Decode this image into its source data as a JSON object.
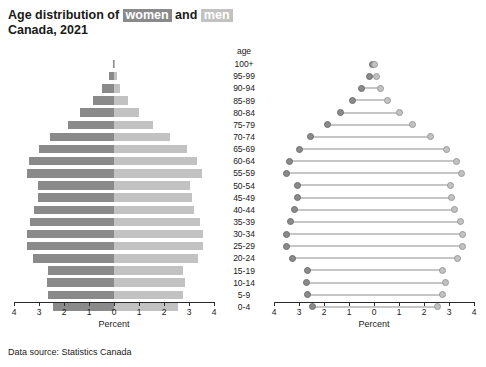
{
  "title": {
    "line1_prefix": "Age distribution of ",
    "women_word": "women",
    "and_word": " and ",
    "men_word": "men",
    "line2": "Canada, 2021"
  },
  "footer": {
    "text": "Data source: Statistics Canada"
  },
  "colors": {
    "women": "#8a8a8a",
    "men": "#c2c2c2",
    "axis": "#2a2a2a",
    "background": "#ffffff"
  },
  "age_column": {
    "header": "age"
  },
  "axis": {
    "title": "Percent",
    "tick_labels": [
      "4",
      "3",
      "2",
      "1",
      "0",
      "1",
      "2",
      "3",
      "4"
    ],
    "tick_values": [
      -4,
      -3,
      -2,
      -1,
      0,
      1,
      2,
      3,
      4
    ],
    "min": -4,
    "max": 4
  },
  "chart_data": [
    {
      "type": "bar",
      "title": "Age distribution of women and men, Canada, 2021",
      "subtype": "population-pyramid",
      "xlabel": "Percent",
      "ylabel": "age",
      "xlim": [
        -4,
        4
      ],
      "grid": false,
      "legend": [
        "women",
        "men"
      ],
      "categories": [
        "100+",
        "95-99",
        "90-94",
        "85-89",
        "80-84",
        "75-79",
        "70-74",
        "65-69",
        "60-64",
        "55-59",
        "50-54",
        "45-49",
        "40-44",
        "35-39",
        "30-34",
        "25-29",
        "20-24",
        "15-19",
        "10-14",
        "5-9",
        "0-4"
      ],
      "series": [
        {
          "name": "women",
          "values": [
            0.05,
            0.2,
            0.5,
            0.85,
            1.35,
            1.85,
            2.55,
            3.0,
            3.4,
            3.5,
            3.05,
            3.05,
            3.2,
            3.35,
            3.5,
            3.5,
            3.25,
            2.65,
            2.7,
            2.65,
            2.45
          ]
        },
        {
          "name": "men",
          "values": [
            0.02,
            0.1,
            0.25,
            0.55,
            1.0,
            1.55,
            2.25,
            2.9,
            3.3,
            3.5,
            3.05,
            3.1,
            3.2,
            3.45,
            3.55,
            3.55,
            3.35,
            2.75,
            2.85,
            2.75,
            2.55
          ]
        }
      ]
    },
    {
      "type": "scatter",
      "title": "Age distribution of women and men, Canada, 2021",
      "subtype": "dumbbell",
      "xlabel": "Percent",
      "ylabel": "age",
      "xlim": [
        -4,
        4
      ],
      "grid": false,
      "legend": [
        "women",
        "men"
      ],
      "categories": [
        "100+",
        "95-99",
        "90-94",
        "85-89",
        "80-84",
        "75-79",
        "70-74",
        "65-69",
        "60-64",
        "55-59",
        "50-54",
        "45-49",
        "40-44",
        "35-39",
        "30-34",
        "25-29",
        "20-24",
        "15-19",
        "10-14",
        "5-9",
        "0-4"
      ],
      "series": [
        {
          "name": "women",
          "values": [
            0.05,
            0.2,
            0.5,
            0.85,
            1.35,
            1.85,
            2.55,
            3.0,
            3.4,
            3.5,
            3.05,
            3.05,
            3.2,
            3.35,
            3.5,
            3.5,
            3.25,
            2.65,
            2.7,
            2.65,
            2.45
          ]
        },
        {
          "name": "men",
          "values": [
            0.02,
            0.1,
            0.25,
            0.55,
            1.0,
            1.55,
            2.25,
            2.9,
            3.3,
            3.5,
            3.05,
            3.1,
            3.2,
            3.45,
            3.55,
            3.55,
            3.35,
            2.75,
            2.85,
            2.75,
            2.55
          ]
        }
      ]
    }
  ]
}
